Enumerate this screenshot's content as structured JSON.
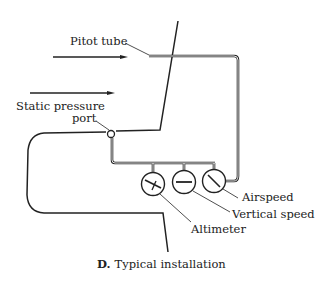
{
  "diagram": {
    "caption_letter": "D.",
    "caption_text": "Typical installation",
    "labels": {
      "pitot_tube": "Pitot tube",
      "static_port_line1": "Static pressure",
      "static_port_line2": "port",
      "airspeed": "Airspeed",
      "vertical_speed": "Vertical speed",
      "altimeter": "Altimeter"
    },
    "colors": {
      "line": "#222222",
      "background": "#ffffff"
    }
  }
}
